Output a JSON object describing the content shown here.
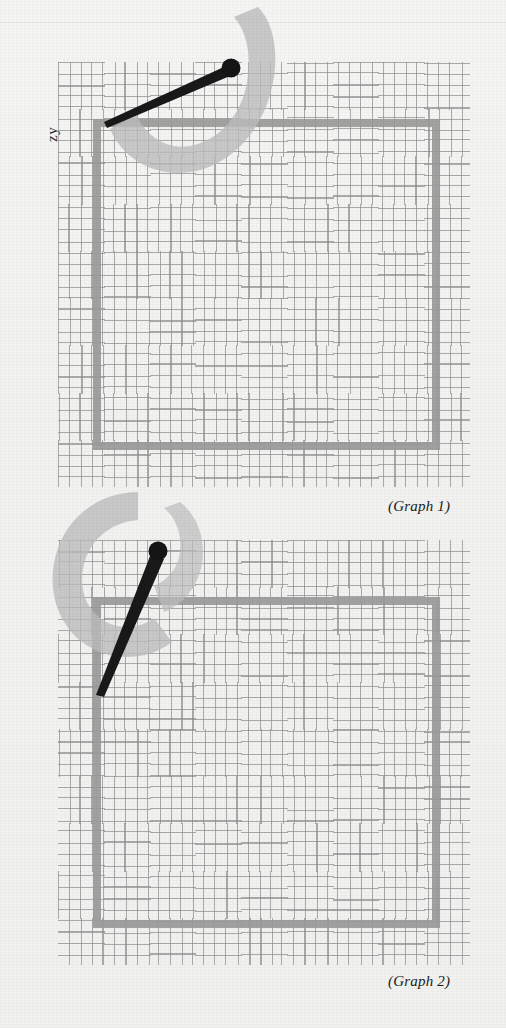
{
  "page": {
    "background_color": "#f2f2f0",
    "seam_y": 22,
    "width": 506,
    "height": 1028
  },
  "axis": {
    "y_label": "zy"
  },
  "palette": {
    "grid_line": "#8e8e8e",
    "square_stroke": "#9a9a9a",
    "swoosh": "#b9b9b9",
    "hand": "#1a1a1a",
    "caption_text": "#1b1b1b"
  },
  "graphs": [
    {
      "caption": "(Graph 1)",
      "grid": {
        "left": 58,
        "top": 62,
        "width": 412,
        "height": 425,
        "cell": 11.2,
        "cols": 37,
        "rows": 38
      },
      "square": {
        "left": 93,
        "top": 119,
        "width": 347,
        "height": 331,
        "stroke": 8
      },
      "swoosh": {
        "shape": "j-hook",
        "cx": 188,
        "cy": 105,
        "r": 74,
        "note": "light gray J-shaped hook opening left, tail curling up at right"
      },
      "hand": {
        "pivot_x": 231,
        "pivot_y": 68,
        "tip_x": 112,
        "tip_y": 122,
        "knob_r": 9,
        "angle_deg": 204
      },
      "caption_pos": {
        "left": 388,
        "top": 498
      }
    },
    {
      "caption": "(Graph 2)",
      "grid": {
        "left": 58,
        "top": 540,
        "width": 412,
        "height": 425,
        "cell": 11.2,
        "cols": 37,
        "rows": 38
      },
      "square": {
        "left": 93,
        "top": 597,
        "width": 347,
        "height": 331,
        "stroke": 8
      },
      "swoosh": {
        "shape": "c-hook",
        "cx": 130,
        "cy": 588,
        "r": 74,
        "note": "light gray reversed-C hook opening right, tail curling up at right"
      },
      "hand": {
        "pivot_x": 158,
        "pivot_y": 551,
        "tip_x": 94,
        "tip_y": 661,
        "knob_r": 9,
        "angle_deg": 240
      },
      "caption_pos": {
        "left": 388,
        "top": 973
      }
    }
  ]
}
